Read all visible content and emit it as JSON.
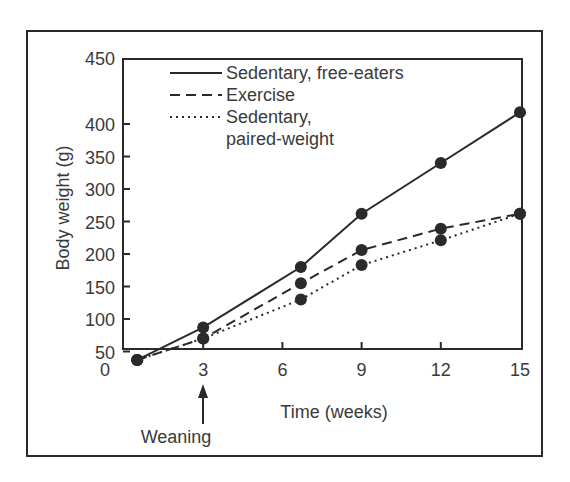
{
  "chart_data": {
    "type": "line",
    "title": "",
    "xlabel": "Time (weeks)",
    "ylabel": "Body weight (g)",
    "xlim": [
      0,
      15
    ],
    "ylim": [
      0,
      450
    ],
    "x_ticks": [
      "0",
      "3",
      "6",
      "9",
      "12",
      "15"
    ],
    "y_ticks": [
      "50",
      "100",
      "150",
      "200",
      "250",
      "300",
      "350",
      "400",
      "450"
    ],
    "grid": false,
    "legend_position": "top-left",
    "annotation": {
      "text": "Weaning",
      "x": 3,
      "arrow": "up"
    },
    "series": [
      {
        "name": "Sedentary, free-eaters",
        "style": "solid",
        "x": [
          0.5,
          3,
          6.7,
          9,
          12,
          15
        ],
        "values": [
          37,
          87,
          180,
          262,
          340,
          418
        ]
      },
      {
        "name": "Exercise",
        "style": "dashed",
        "x": [
          0.5,
          3,
          6.7,
          9,
          12,
          15
        ],
        "values": [
          37,
          70,
          155,
          206,
          239,
          262
        ]
      },
      {
        "name": "Sedentary, paired-weight",
        "legend_lines": [
          "Sedentary,",
          "paired-weight"
        ],
        "style": "dotted",
        "x": [
          0.5,
          3,
          6.7,
          9,
          12,
          15
        ],
        "values": [
          37,
          70,
          130,
          183,
          221,
          262
        ]
      }
    ]
  }
}
